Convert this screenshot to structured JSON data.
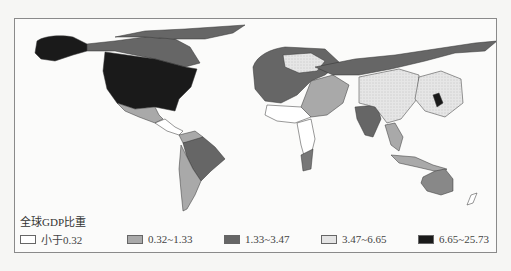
{
  "legend": {
    "title": "全球GDP比重",
    "items": [
      {
        "label": "小于0.32",
        "color": "#ffffff",
        "hatch": false
      },
      {
        "label": "0.32~1.33",
        "color": "#a9a9a9",
        "hatch": false
      },
      {
        "label": "1.33~3.47",
        "color": "#666666",
        "hatch": false
      },
      {
        "label": "3.47~6.65",
        "color": "#e4e4e4",
        "hatch": true
      },
      {
        "label": "6.65~25.73",
        "color": "#1a1a1a",
        "hatch": false
      }
    ]
  },
  "map": {
    "type": "cartogram",
    "subject": "World countries sized/shaded by share of global GDP (%)",
    "regions": [
      {
        "name": "United States",
        "class": "6.65~25.73"
      },
      {
        "name": "Canada",
        "class": "1.33~3.47"
      },
      {
        "name": "Mexico",
        "class": "0.32~1.33"
      },
      {
        "name": "Brazil",
        "class": "1.33~3.47"
      },
      {
        "name": "Argentina/Chile",
        "class": "0.32~1.33"
      },
      {
        "name": "Western Europe",
        "class": "1.33~3.47"
      },
      {
        "name": "Germany",
        "class": "3.47~6.65"
      },
      {
        "name": "Russia",
        "class": "1.33~3.47"
      },
      {
        "name": "India",
        "class": "1.33~3.47"
      },
      {
        "name": "China",
        "class": "3.47~6.65"
      },
      {
        "name": "Japan",
        "class": "6.65~25.73"
      },
      {
        "name": "Australia",
        "class": "1.33~3.47"
      },
      {
        "name": "South Africa",
        "class": "0.32~1.33"
      },
      {
        "name": "Indonesia",
        "class": "0.32~1.33"
      }
    ]
  }
}
